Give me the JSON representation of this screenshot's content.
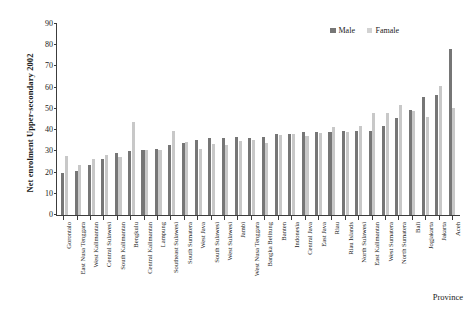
{
  "chart_data": {
    "type": "bar",
    "title": "",
    "ylabel": "Net enrolment Upper-secondary 2002",
    "xlabel": "Province",
    "ylim": [
      0,
      90
    ],
    "yticks": [
      0,
      10,
      20,
      30,
      40,
      50,
      60,
      70,
      80,
      90
    ],
    "grid": false,
    "legend_position": "top-right",
    "colors": {
      "male": "#767676",
      "female": "#c8c8c8"
    },
    "categories": [
      "Gorontalo",
      "East Nusa Tenggara",
      "West Kalimantan",
      "Central Sulawesi",
      "South Kalimantan",
      "Bengkulu",
      "Central Kalimantan",
      "Lampung",
      "Southeast Sulawesi",
      "South Sumatera",
      "West Java",
      "South Sulawesi",
      "West Sulawesi",
      "Jambi",
      "West Nusa Tenggara",
      "Bangka Belitung",
      "Banten",
      "Indonesia",
      "Central Java",
      "East Java",
      "Riau",
      "Riau Islands",
      "North Sulawesi",
      "East Kalimantan",
      "West Sumatera",
      "North Sumatera",
      "Bali",
      "Jogjakarta",
      "Jakarta",
      "Aceh"
    ],
    "series": [
      {
        "name": "Male",
        "values": [
          19.6,
          20.8,
          23.6,
          26.2,
          29.1,
          30.3,
          30.5,
          31.0,
          33.0,
          33.9,
          35.4,
          36.1,
          36.1,
          36.6,
          36.2,
          36.9,
          38.0,
          38.3,
          39.1,
          39.0,
          39.1,
          39.4,
          39.5,
          39.7,
          42.0,
          45.7,
          49.4,
          55.6,
          56.5,
          78.0
        ]
      },
      {
        "name": "Famale",
        "values": [
          27.6,
          23.8,
          26.4,
          28.5,
          27.5,
          43.8,
          30.7,
          30.6,
          39.5,
          34.4,
          31.0,
          33.5,
          33.2,
          35.0,
          35.5,
          33.7,
          37.6,
          38.0,
          37.3,
          38.6,
          41.3,
          39.1,
          41.9,
          48.0,
          48.2,
          51.8,
          49.2,
          46.2,
          60.8,
          50.4
        ]
      }
    ],
    "legend": [
      {
        "label": "Male",
        "color": "#767676"
      },
      {
        "label": "Famale",
        "color": "#d2d2d2"
      }
    ]
  }
}
